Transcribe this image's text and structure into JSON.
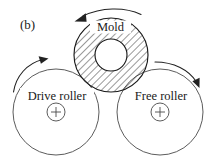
{
  "figure": {
    "panel_label": "(b)",
    "background_color": "#ffffff",
    "line_color": "#1a1a1a",
    "hatch_color": "#333333",
    "width": 215,
    "height": 164
  },
  "mold": {
    "label": "Mold",
    "rotation_arrow_name": "mold-rotation-arrow",
    "rotation_direction": "counterclockwise",
    "outer_radius": 37,
    "inner_radius": 16,
    "center_x": 111,
    "center_y": 55,
    "fill_pattern": "diagonal-hatch"
  },
  "rollers": [
    {
      "label": "Drive roller",
      "name": "drive-roller",
      "center_x": 56,
      "center_y": 112,
      "radius": 43,
      "hub_radius": 9,
      "hub_marker": "+",
      "rotation_direction": "clockwise"
    },
    {
      "label": "Free roller",
      "name": "free-roller",
      "center_x": 160,
      "center_y": 112,
      "radius": 43,
      "hub_radius": 9,
      "hub_marker": "+",
      "rotation_direction": "clockwise"
    }
  ]
}
